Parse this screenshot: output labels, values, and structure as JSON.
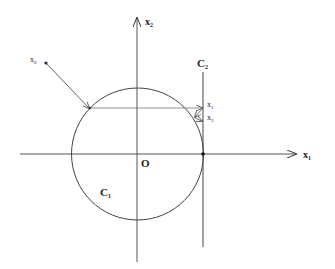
{
  "diagram": {
    "axes": {
      "x1_label": "x",
      "x1_sub": "1",
      "x2_label": "x",
      "x2_sub": "2",
      "origin_label": "O"
    },
    "circle": {
      "label": "C",
      "sub": "1"
    },
    "line": {
      "label": "C",
      "sub": "2"
    },
    "points": {
      "x0": {
        "label": "x",
        "sub": "0"
      },
      "x1": {
        "label": "x",
        "sub": "1"
      },
      "x2": {
        "label": "x",
        "sub": "2"
      }
    }
  }
}
